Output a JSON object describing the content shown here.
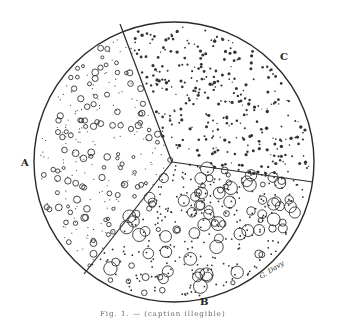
{
  "figure": {
    "labels": {
      "a": "A",
      "b": "B",
      "c": "C"
    },
    "signature": "G. Davy",
    "caption": "Fig. 1. — (caption illegible)",
    "colors": {
      "ink": "#2a2a2a",
      "paper": "#ffffff"
    }
  }
}
